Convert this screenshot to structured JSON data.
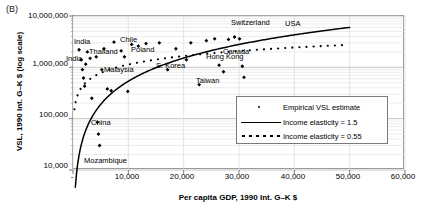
{
  "figure": {
    "panel_label": "(B)"
  },
  "chart_data": {
    "type": "scatter",
    "title": "",
    "xlabel": "Per capita GDP, 1990 Int. G–K $",
    "ylabel": "VSL, 1990 Int. G–K $ (log scale)",
    "yscale": "log",
    "xlim": [
      0,
      60000
    ],
    "ylim": [
      10000,
      10000000
    ],
    "grid": true,
    "xticks": [
      0,
      10000,
      20000,
      30000,
      40000,
      50000,
      60000
    ],
    "xticklabels": [
      "-",
      "10,000",
      "20,000",
      "30,000",
      "40,000",
      "50,000",
      "60,000"
    ],
    "yticks": [
      10000,
      100000,
      1000000,
      10000000
    ],
    "yticklabels": [
      "10,000",
      "100,000",
      "1,000,000",
      "10,000,000"
    ],
    "legend_position": "center-right",
    "series": [
      {
        "name": "Empirical VSL estimate",
        "type": "scatter",
        "marker": "diamond",
        "color": "#000000",
        "points": [
          [
            1100,
            2200000
          ],
          [
            1500,
            1400000
          ],
          [
            1700,
            900000
          ],
          [
            1900,
            620000
          ],
          [
            2100,
            430000
          ],
          [
            2300,
            1150000
          ],
          [
            2600,
            2000000
          ],
          [
            3100,
            1500000
          ],
          [
            3400,
            250000
          ],
          [
            4200,
            1600000
          ],
          [
            4400,
            85000
          ],
          [
            4600,
            50000
          ],
          [
            4800,
            30000
          ],
          [
            5200,
            900000
          ],
          [
            5600,
            2300000
          ],
          [
            6200,
            380000
          ],
          [
            6900,
            350000
          ],
          [
            7400,
            3100000
          ],
          [
            8700,
            2100000
          ],
          [
            9300,
            1600000
          ],
          [
            9900,
            340000
          ],
          [
            10600,
            2800000
          ],
          [
            11800,
            2600000
          ],
          [
            13200,
            2900000
          ],
          [
            15600,
            3000000
          ],
          [
            17100,
            900000
          ],
          [
            18600,
            2300000
          ],
          [
            20500,
            1400000
          ],
          [
            21300,
            3000000
          ],
          [
            22800,
            460000
          ],
          [
            24100,
            3300000
          ],
          [
            25600,
            3600000
          ],
          [
            26400,
            1100000
          ],
          [
            27200,
            820000
          ],
          [
            28100,
            3500000
          ],
          [
            29200,
            3900000
          ],
          [
            30100,
            3600000
          ],
          [
            30600,
            1050000
          ],
          [
            30900,
            640000
          ]
        ]
      },
      {
        "name": "Income elasticity = 1.5",
        "type": "line",
        "style": "solid",
        "color": "#000000"
      },
      {
        "name": "Income elasticity = 0.55",
        "type": "line",
        "style": "dotted",
        "color": "#000000"
      }
    ],
    "annotations": [
      {
        "label": "India",
        "x": 74,
        "y": 38
      },
      {
        "label": "India",
        "x": 66,
        "y": 55
      },
      {
        "label": "Thailand",
        "x": 89,
        "y": 48
      },
      {
        "label": "Chile",
        "x": 120,
        "y": 36
      },
      {
        "label": "Poland",
        "x": 131,
        "y": 46
      },
      {
        "label": "Malaysia",
        "x": 104,
        "y": 66
      },
      {
        "label": "S. Korea",
        "x": 156,
        "y": 62
      },
      {
        "label": "Taiwan",
        "x": 196,
        "y": 77
      },
      {
        "label": "Switzerland",
        "x": 231,
        "y": 19
      },
      {
        "label": "USA",
        "x": 285,
        "y": 20
      },
      {
        "label": "Canada",
        "x": 223,
        "y": 48
      },
      {
        "label": "Hong Kong",
        "x": 206,
        "y": 53
      },
      {
        "label": "China",
        "x": 91,
        "y": 119
      },
      {
        "label": "Mozambique",
        "x": 84,
        "y": 157
      }
    ]
  },
  "legend": {
    "items": [
      {
        "label": "Empirical VSL estimate",
        "key": "marker-diamond"
      },
      {
        "label": "Income elasticity = 1.5",
        "key": "line-solid"
      },
      {
        "label": "Income elasticity = 0.55",
        "key": "line-dotted"
      }
    ]
  }
}
